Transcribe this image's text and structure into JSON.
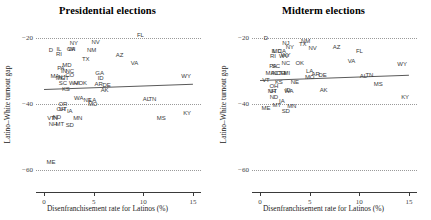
{
  "figure": {
    "width": 431,
    "height": 220,
    "background": "#ffffff",
    "point_label_color": "#3a3a3a",
    "fitline_color": "#5a5a5a",
    "gridline_color": "#9a9a9a"
  },
  "chart_data": [
    {
      "type": "scatter",
      "title": "Presidential elections",
      "xlabel": "Disenfranchisement rate for Latinos (%)",
      "ylabel": "Latino–White turnout gap",
      "xlim": [
        -0.8,
        15.8
      ],
      "ylim": [
        -63,
        -17
      ],
      "xticks": [
        0,
        5,
        10,
        15
      ],
      "xticklabels": [
        "0",
        "5",
        "10",
        "15"
      ],
      "yticks": [
        -20,
        -40,
        -60
      ],
      "yticklabels": [
        "−20",
        "−40",
        "−60"
      ],
      "grid": "horizontal-dotted",
      "legend": "none",
      "fit_line": {
        "x0": 0.0,
        "y0": -35.6,
        "x1": 15.0,
        "y1": -34.0
      },
      "points": [
        {
          "label": "FL",
          "x": 9.7,
          "y": -19.2
        },
        {
          "label": "NY",
          "x": 3.0,
          "y": -21.4
        },
        {
          "label": "NV",
          "x": 5.2,
          "y": -21.3
        },
        {
          "label": "IL",
          "x": 1.5,
          "y": -23.3
        },
        {
          "label": "CA",
          "x": 2.7,
          "y": -23.4
        },
        {
          "label": "WI",
          "x": 2.8,
          "y": -23.5
        },
        {
          "label": "NM",
          "x": 4.8,
          "y": -23.6
        },
        {
          "label": "D",
          "x": 0.7,
          "y": -23.6
        },
        {
          "label": "RI",
          "x": 1.5,
          "y": -25.0
        },
        {
          "label": "AZ",
          "x": 7.6,
          "y": -25.1
        },
        {
          "label": "TX",
          "x": 4.2,
          "y": -26.3
        },
        {
          "label": "MD",
          "x": 2.3,
          "y": -28.2
        },
        {
          "label": "PA",
          "x": 1.7,
          "y": -29.0
        },
        {
          "label": "IN",
          "x": 2.0,
          "y": -29.9
        },
        {
          "label": "NC",
          "x": 2.6,
          "y": -30.0
        },
        {
          "label": "VA",
          "x": 9.1,
          "y": -27.6
        },
        {
          "label": "CO",
          "x": 2.6,
          "y": -31.1
        },
        {
          "label": "MA",
          "x": 1.1,
          "y": -31.6
        },
        {
          "label": "NJ",
          "x": 1.8,
          "y": -31.8
        },
        {
          "label": "CT",
          "x": 2.1,
          "y": -32.0
        },
        {
          "label": "MI",
          "x": 1.5,
          "y": -32.2
        },
        {
          "label": "GA",
          "x": 5.6,
          "y": -30.5
        },
        {
          "label": "WY",
          "x": 14.3,
          "y": -31.6
        },
        {
          "label": "SC",
          "x": 1.9,
          "y": -33.7
        },
        {
          "label": "WV",
          "x": 3.0,
          "y": -33.6
        },
        {
          "label": "HI",
          "x": 3.3,
          "y": -33.6
        },
        {
          "label": "OK",
          "x": 3.9,
          "y": -33.5
        },
        {
          "label": "ID",
          "x": 5.7,
          "y": -32.0
        },
        {
          "label": "AR",
          "x": 5.5,
          "y": -33.9
        },
        {
          "label": "DE",
          "x": 6.3,
          "y": -34.3
        },
        {
          "label": "KS",
          "x": 2.2,
          "y": -35.5
        },
        {
          "label": "AK",
          "x": 6.1,
          "y": -35.8
        },
        {
          "label": "WA",
          "x": 3.5,
          "y": -38.3
        },
        {
          "label": "NE",
          "x": 4.4,
          "y": -38.7
        },
        {
          "label": "LA",
          "x": 4.9,
          "y": -38.8
        },
        {
          "label": "AL",
          "x": 10.3,
          "y": -38.6
        },
        {
          "label": "TN",
          "x": 10.9,
          "y": -38.6
        },
        {
          "label": "OR",
          "x": 1.9,
          "y": -40.0
        },
        {
          "label": "MO",
          "x": 4.9,
          "y": -40.0
        },
        {
          "label": "OH",
          "x": 1.7,
          "y": -41.4
        },
        {
          "label": "UT",
          "x": 1.9,
          "y": -41.5
        },
        {
          "label": "IA",
          "x": 2.6,
          "y": -42.2
        },
        {
          "label": "VT",
          "x": 0.7,
          "y": -44.1
        },
        {
          "label": "ND",
          "x": 1.3,
          "y": -44.0
        },
        {
          "label": "IN2",
          "x": 1.1,
          "y": -44.1
        },
        {
          "label": "MN",
          "x": 3.4,
          "y": -44.3
        },
        {
          "label": "KY",
          "x": 14.4,
          "y": -42.7
        },
        {
          "label": "MS",
          "x": 11.8,
          "y": -44.2
        },
        {
          "label": "NH",
          "x": 0.9,
          "y": -46.1
        },
        {
          "label": "MT",
          "x": 1.6,
          "y": -46.2
        },
        {
          "label": "SD",
          "x": 2.6,
          "y": -46.3
        },
        {
          "label": "ME",
          "x": 0.7,
          "y": -57.7
        }
      ]
    },
    {
      "type": "scatter",
      "title": "Midterm elections",
      "xlabel": "Disenfranchisement rate for Latinos (%)",
      "ylabel": "Latino–White turnout gap",
      "xlim": [
        -0.8,
        15.8
      ],
      "ylim": [
        -63,
        -17
      ],
      "xticks": [
        0,
        5,
        10,
        15
      ],
      "xticklabels": [
        "0",
        "5",
        "10",
        "15"
      ],
      "yticks": [
        -20,
        -40,
        -60
      ],
      "yticklabels": [
        "−20",
        "−40",
        "−60"
      ],
      "grid": "horizontal-dotted",
      "legend": "none",
      "fit_line": {
        "x0": 0.0,
        "y0": -32.6,
        "x1": 15.0,
        "y1": -31.0
      },
      "points": [
        {
          "label": "D",
          "x": 0.6,
          "y": -19.9
        },
        {
          "label": "NM",
          "x": 4.6,
          "y": -20.8
        },
        {
          "label": "NJ",
          "x": 2.6,
          "y": -21.6
        },
        {
          "label": "TX",
          "x": 4.3,
          "y": -21.8
        },
        {
          "label": "NY",
          "x": 3.0,
          "y": -22.8
        },
        {
          "label": "NV",
          "x": 5.3,
          "y": -23.0
        },
        {
          "label": "AZ",
          "x": 7.7,
          "y": -22.6
        },
        {
          "label": "IL",
          "x": 1.4,
          "y": -24.0
        },
        {
          "label": "MD",
          "x": 1.7,
          "y": -24.1
        },
        {
          "label": "CA",
          "x": 2.2,
          "y": -24.0
        },
        {
          "label": "FL",
          "x": 10.0,
          "y": -24.0
        },
        {
          "label": "WY",
          "x": 2.6,
          "y": -25.2
        },
        {
          "label": "RI",
          "x": 1.3,
          "y": -25.6
        },
        {
          "label": "WV",
          "x": 2.4,
          "y": -25.4
        },
        {
          "label": "VA",
          "x": 9.2,
          "y": -26.9
        },
        {
          "label": "NC",
          "x": 2.6,
          "y": -27.6
        },
        {
          "label": "OK",
          "x": 4.0,
          "y": -27.7
        },
        {
          "label": "PA",
          "x": 1.3,
          "y": -28.5
        },
        {
          "label": "SC",
          "x": 1.6,
          "y": -28.6
        },
        {
          "label": "WY2",
          "x": 14.3,
          "y": -28.0
        },
        {
          "label": "LA",
          "x": 5.0,
          "y": -29.9
        },
        {
          "label": "MA",
          "x": 1.0,
          "y": -30.6
        },
        {
          "label": "IN",
          "x": 1.4,
          "y": -30.6
        },
        {
          "label": "CT",
          "x": 1.8,
          "y": -30.7
        },
        {
          "label": "CO",
          "x": 2.1,
          "y": -30.7
        },
        {
          "label": "HI",
          "x": 2.4,
          "y": -30.6
        },
        {
          "label": "MI",
          "x": 2.7,
          "y": -30.7
        },
        {
          "label": "AR",
          "x": 5.6,
          "y": -31.0
        },
        {
          "label": "DE",
          "x": 6.3,
          "y": -31.1
        },
        {
          "label": "AL",
          "x": 10.4,
          "y": -31.6
        },
        {
          "label": "TN",
          "x": 11.0,
          "y": -31.1
        },
        {
          "label": "MO",
          "x": 5.0,
          "y": -31.8
        },
        {
          "label": "VT",
          "x": 0.6,
          "y": -32.8
        },
        {
          "label": "KS",
          "x": 1.9,
          "y": -33.3
        },
        {
          "label": "NE",
          "x": 3.5,
          "y": -33.4
        },
        {
          "label": "MS",
          "x": 11.9,
          "y": -34.0
        },
        {
          "label": "OH",
          "x": 1.4,
          "y": -34.7
        },
        {
          "label": "AK",
          "x": 6.4,
          "y": -35.8
        },
        {
          "label": "NH",
          "x": 1.2,
          "y": -36.0
        },
        {
          "label": "UT",
          "x": 1.3,
          "y": -36.1
        },
        {
          "label": "WA",
          "x": 2.9,
          "y": -36.0
        },
        {
          "label": "ID",
          "x": 2.8,
          "y": -35.8
        },
        {
          "label": "ND",
          "x": 1.4,
          "y": -37.9
        },
        {
          "label": "KY",
          "x": 14.6,
          "y": -38.0
        },
        {
          "label": "IA",
          "x": 2.2,
          "y": -39.1
        },
        {
          "label": "MT",
          "x": 1.7,
          "y": -40.4
        },
        {
          "label": "MN",
          "x": 3.2,
          "y": -40.5
        },
        {
          "label": "ME",
          "x": 0.6,
          "y": -41.2
        },
        {
          "label": "SD",
          "x": 2.6,
          "y": -42.2
        }
      ]
    }
  ]
}
